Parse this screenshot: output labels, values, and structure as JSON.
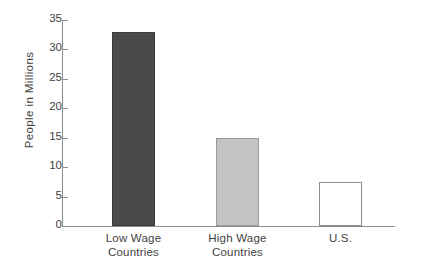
{
  "chart_data": {
    "type": "bar",
    "title": "",
    "subtitle": "",
    "xlabel": "",
    "ylabel": "People  in  Millions",
    "categories": [
      "Low Wage Countries",
      "High Wage Countries",
      "U.S."
    ],
    "category_lines": [
      [
        "Low Wage",
        "Countries"
      ],
      [
        "High Wage",
        "Countries"
      ],
      [
        "U.S.",
        ""
      ]
    ],
    "values": [
      33,
      15,
      7.5
    ],
    "ylim": [
      0,
      35
    ],
    "yticks": [
      0,
      5,
      10,
      15,
      20,
      25,
      30,
      35
    ],
    "ytick_labels": [
      "0",
      "5",
      "10",
      "15",
      "20",
      "25",
      "30",
      "35"
    ],
    "grid": false,
    "legend": "none",
    "bar_colors": [
      "#4a4a4a",
      "#c3c3c3",
      "#ffffff"
    ],
    "bar_edge_colors": [
      "#3a3a3a",
      "#9a9a9a",
      "#8d8d8d"
    ],
    "axis_color": "#8d8d8d",
    "text_color": "#3f3f3f",
    "background": "#ffffff"
  }
}
